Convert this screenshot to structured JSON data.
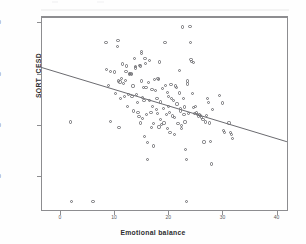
{
  "chart_data": {
    "type": "scatter",
    "title": "",
    "xlabel": "Emotional balance",
    "ylabel": "SQRT_CESD",
    "xlim": [
      -3.5,
      42.1
    ],
    "ylim": [
      0.65,
      8.25
    ],
    "grid": false,
    "legend": null,
    "marker": "open-circle",
    "xticks": [
      0,
      10,
      20,
      30,
      40
    ],
    "xtick_labels": [
      "0",
      "10",
      "20",
      "30",
      "40"
    ],
    "yticks": [
      2.0,
      4.0,
      6.0,
      8.0
    ],
    "ytick_labels": [
      "2.00",
      "4.00",
      "6.00",
      "8.00"
    ],
    "fit_line": {
      "type": "linear-regression",
      "x_start": -3.5,
      "y_start": 6.25,
      "x_end": 41.9,
      "y_end": 3.35
    },
    "points": [
      [
        2.0,
        4.12
      ],
      [
        2.2,
        1.02
      ],
      [
        6.1,
        1.02
      ],
      [
        8.5,
        7.22
      ],
      [
        8.6,
        6.18
      ],
      [
        9.0,
        5.55
      ],
      [
        9.3,
        6.08
      ],
      [
        9.4,
        4.13
      ],
      [
        10.1,
        6.07
      ],
      [
        10.3,
        5.22
      ],
      [
        10.6,
        7.05
      ],
      [
        10.7,
        7.28
      ],
      [
        10.8,
        5.72
      ],
      [
        10.9,
        3.9
      ],
      [
        11.2,
        5.05
      ],
      [
        11.4,
        5.8
      ],
      [
        11.6,
        6.38
      ],
      [
        11.8,
        5.62
      ],
      [
        11.9,
        5.12
      ],
      [
        12.1,
        5.74
      ],
      [
        12.3,
        6.3
      ],
      [
        12.4,
        4.72
      ],
      [
        12.6,
        5.18
      ],
      [
        12.8,
        6.02
      ],
      [
        12.9,
        5.98
      ],
      [
        13.1,
        6.02
      ],
      [
        13.2,
        5.96
      ],
      [
        13.3,
        5.1
      ],
      [
        13.5,
        5.52
      ],
      [
        13.6,
        4.55
      ],
      [
        13.8,
        6.58
      ],
      [
        13.9,
        6.22
      ],
      [
        14.0,
        6.27
      ],
      [
        14.2,
        5.18
      ],
      [
        14.3,
        4.88
      ],
      [
        14.4,
        4.5
      ],
      [
        14.6,
        4.32
      ],
      [
        14.7,
        6.32
      ],
      [
        14.8,
        6.3
      ],
      [
        14.9,
        4.08
      ],
      [
        15.0,
        6.86
      ],
      [
        15.0,
        6.78
      ],
      [
        15.1,
        5.72
      ],
      [
        15.2,
        5.06
      ],
      [
        15.3,
        4.26
      ],
      [
        15.4,
        5.46
      ],
      [
        15.5,
        4.95
      ],
      [
        15.6,
        3.55
      ],
      [
        15.8,
        6.41
      ],
      [
        15.9,
        5.45
      ],
      [
        16.0,
        4.4
      ],
      [
        16.1,
        3.32
      ],
      [
        16.2,
        2.65
      ],
      [
        16.4,
        5.65
      ],
      [
        16.5,
        6.51
      ],
      [
        16.6,
        4.95
      ],
      [
        16.8,
        4.48
      ],
      [
        16.9,
        3.9
      ],
      [
        17.0,
        5.38
      ],
      [
        17.1,
        4.72
      ],
      [
        17.2,
        4.05
      ],
      [
        17.3,
        3.18
      ],
      [
        17.5,
        5.76
      ],
      [
        17.6,
        5.34
      ],
      [
        17.8,
        4.62
      ],
      [
        17.9,
        5.02
      ],
      [
        18.0,
        4.44
      ],
      [
        18.1,
        5.82
      ],
      [
        18.2,
        5.78
      ],
      [
        18.3,
        3.92
      ],
      [
        18.5,
        4.22
      ],
      [
        18.6,
        4.9
      ],
      [
        18.8,
        4.02
      ],
      [
        19.0,
        5.42
      ],
      [
        19.1,
        4.65
      ],
      [
        19.2,
        4.08
      ],
      [
        19.4,
        7.22
      ],
      [
        19.5,
        5.55
      ],
      [
        19.6,
        4.42
      ],
      [
        19.8,
        3.85
      ],
      [
        20.0,
        4.72
      ],
      [
        20.1,
        5.12
      ],
      [
        20.2,
        4.48
      ],
      [
        20.3,
        3.7
      ],
      [
        20.5,
        5.58
      ],
      [
        20.6,
        5.04
      ],
      [
        20.8,
        4.35
      ],
      [
        21.0,
        4.96
      ],
      [
        21.1,
        4.28
      ],
      [
        21.2,
        3.62
      ],
      [
        21.4,
        5.52
      ],
      [
        21.5,
        5.46
      ],
      [
        21.6,
        4.82
      ],
      [
        21.8,
        4.05
      ],
      [
        22.0,
        6.11
      ],
      [
        22.1,
        5.25
      ],
      [
        22.2,
        4.64
      ],
      [
        22.3,
        4.55
      ],
      [
        22.4,
        3.98
      ],
      [
        22.5,
        3.88
      ],
      [
        22.6,
        7.82
      ],
      [
        22.8,
        5.02
      ],
      [
        22.9,
        4.4
      ],
      [
        23.0,
        4.7
      ],
      [
        23.1,
        4.12
      ],
      [
        23.2,
        3.05
      ],
      [
        23.3,
        2.65
      ],
      [
        23.4,
        1.02
      ],
      [
        23.6,
        5.6
      ],
      [
        23.8,
        4.46
      ],
      [
        24.0,
        7.84
      ],
      [
        24.1,
        7.22
      ],
      [
        24.2,
        6.56
      ],
      [
        24.3,
        6.48
      ],
      [
        24.4,
        5.22
      ],
      [
        24.6,
        4.68
      ],
      [
        24.8,
        4.45
      ],
      [
        25.0,
        4.72
      ],
      [
        25.2,
        4.5
      ],
      [
        25.4,
        4.4
      ],
      [
        25.6,
        4.32
      ],
      [
        25.8,
        4.42
      ],
      [
        26.0,
        4.38
      ],
      [
        26.2,
        4.3
      ],
      [
        26.4,
        4.22
      ],
      [
        26.6,
        3.34
      ],
      [
        26.8,
        4.12
      ],
      [
        27.0,
        4.38
      ],
      [
        27.2,
        5.02
      ],
      [
        27.4,
        4.88
      ],
      [
        27.6,
        4.08
      ],
      [
        27.8,
        3.35
      ],
      [
        28.0,
        2.48
      ],
      [
        28.2,
        4.62
      ],
      [
        29.5,
        5.14
      ],
      [
        30.0,
        4.86
      ],
      [
        30.2,
        3.78
      ],
      [
        30.4,
        3.7
      ],
      [
        31.2,
        4.08
      ],
      [
        31.5,
        3.72
      ],
      [
        31.6,
        3.62
      ],
      [
        31.8,
        3.48
      ],
      [
        24.6,
        6.44
      ],
      [
        23.5,
        5.72
      ],
      [
        19.9,
        5.26
      ],
      [
        18.4,
        6.46
      ],
      [
        15.7,
        6.6
      ],
      [
        12.2,
        6.08
      ],
      [
        11.1,
        5.68
      ]
    ]
  }
}
